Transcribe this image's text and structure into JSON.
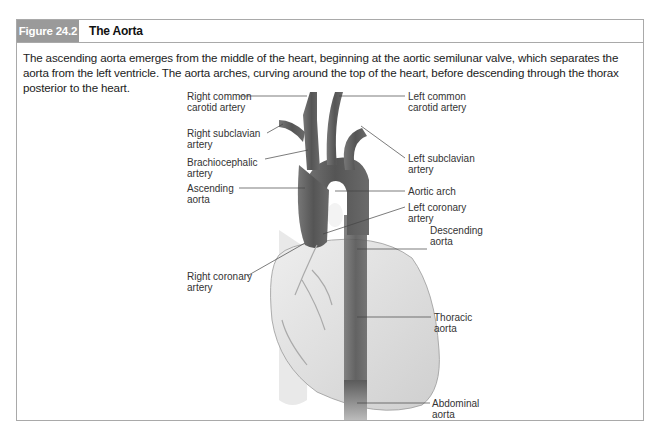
{
  "figure": {
    "number": "Figure 24.2",
    "title": "The Aorta",
    "caption": "The ascending aorta emerges from the middle of the heart, beginning at the aortic semilunar valve, which separates the aorta from the left ventricle. The aorta arches, curving around the top of the heart, before descending through the thorax posterior to the heart.",
    "colors": {
      "header_bg": "#9a9a9a",
      "border": "#a9a9a9",
      "vessel": "#5a5a5a",
      "heart": "#dcdcdc"
    }
  },
  "labels": {
    "left": [
      {
        "id": "right-common-carotid-artery",
        "text": "Right common\ncarotid artery"
      },
      {
        "id": "right-subclavian-artery",
        "text": "Right subclavian\nartery"
      },
      {
        "id": "brachiocephalic-artery",
        "text": "Brachiocephalic\nartery"
      },
      {
        "id": "ascending-aorta",
        "text": "Ascending\naorta"
      },
      {
        "id": "right-coronary-artery",
        "text": "Right coronary\nartery"
      }
    ],
    "right": [
      {
        "id": "left-common-carotid-artery",
        "text": "Left common\ncarotid artery"
      },
      {
        "id": "left-subclavian-artery",
        "text": "Left subclavian\nartery"
      },
      {
        "id": "aortic-arch",
        "text": "Aortic arch"
      },
      {
        "id": "left-coronary-artery",
        "text": "Left coronary\nartery"
      },
      {
        "id": "descending-aorta",
        "text": "Descending\naorta"
      },
      {
        "id": "thoracic-aorta",
        "text": "Thoracic\naorta"
      },
      {
        "id": "abdominal-aorta",
        "text": "Abdominal\naorta"
      }
    ]
  }
}
